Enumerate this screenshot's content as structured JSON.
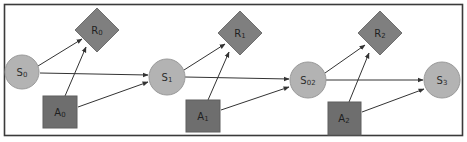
{
  "diagram": {
    "type": "markov-decision-process",
    "colors": {
      "state_fill": "#b3b3b3",
      "action_fill": "#6e6e6e",
      "reward_fill": "#7f7f7f",
      "edge": "#333333",
      "frame": "#3a3a3a"
    },
    "nodes": {
      "s0": {
        "base": "S",
        "sub": "0",
        "shape": "circle"
      },
      "a0": {
        "base": "A",
        "sub": "0",
        "shape": "square"
      },
      "r0": {
        "base": "R",
        "sub": "0",
        "shape": "diamond"
      },
      "s1": {
        "base": "S",
        "sub": "1",
        "shape": "circle"
      },
      "a1": {
        "base": "A",
        "sub": "1",
        "shape": "square"
      },
      "r1": {
        "base": "R",
        "sub": "1",
        "shape": "diamond"
      },
      "s2": {
        "base": "S",
        "sub": "02",
        "shape": "circle"
      },
      "a2": {
        "base": "A",
        "sub": "2",
        "shape": "square"
      },
      "r2": {
        "base": "R",
        "sub": "2",
        "shape": "diamond"
      },
      "s3": {
        "base": "S",
        "sub": "3",
        "shape": "circle"
      }
    },
    "edges": [
      {
        "from": "S0",
        "to": "R0"
      },
      {
        "from": "A0",
        "to": "R0"
      },
      {
        "from": "S0",
        "to": "S1"
      },
      {
        "from": "A0",
        "to": "S1"
      },
      {
        "from": "S1",
        "to": "R1"
      },
      {
        "from": "A1",
        "to": "R1"
      },
      {
        "from": "S1",
        "to": "S02"
      },
      {
        "from": "A1",
        "to": "S02"
      },
      {
        "from": "S02",
        "to": "R2"
      },
      {
        "from": "A2",
        "to": "R2"
      },
      {
        "from": "S02",
        "to": "S3"
      },
      {
        "from": "A2",
        "to": "S3"
      }
    ]
  }
}
